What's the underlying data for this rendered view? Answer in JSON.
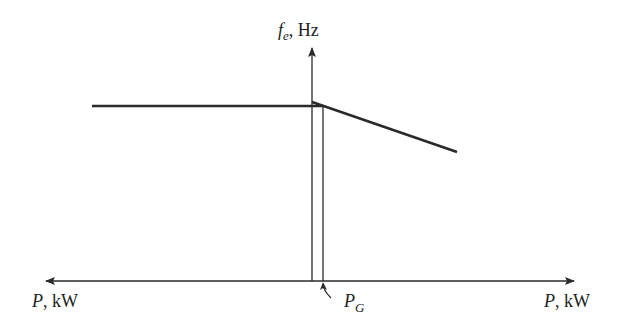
{
  "diagram": {
    "y_axis_label_symbol": "f",
    "y_axis_label_subscript": "e",
    "y_axis_label_unit": ", Hz",
    "x_axis_left_label_symbol": "P",
    "x_axis_left_label_unit": ", kW",
    "x_axis_right_label_symbol": "P",
    "x_axis_right_label_unit": ", kW",
    "pg_label_symbol": "P",
    "pg_label_subscript": "G",
    "curves": [
      {
        "name": "system-frequency",
        "description": "flat infinite-bus frequency line"
      },
      {
        "name": "generator-droop",
        "description": "generator frequency-power droop line"
      }
    ],
    "line_color": "#2a2a2a"
  }
}
